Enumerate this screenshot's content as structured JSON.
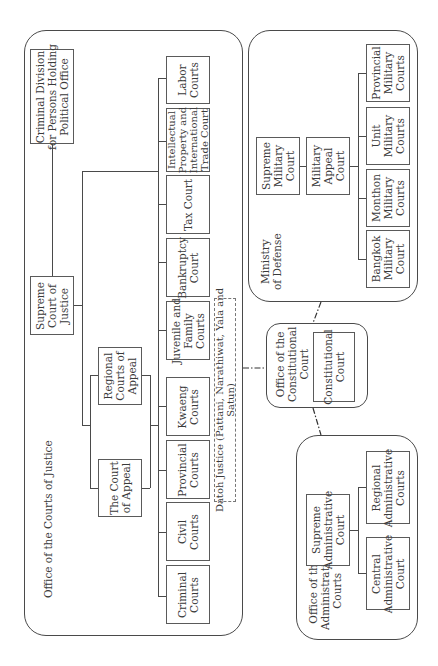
{
  "diagram": {
    "orientation": "rotated-90-ccw",
    "groups": {
      "courts_of_justice": {
        "label": "Office of the Courts of Justice",
        "boxes": {
          "criminal_division": [
            "Criminal Division",
            "for Persons Holding",
            "Political Office"
          ],
          "supreme_court": [
            "Supreme",
            "Court of",
            "Justice"
          ],
          "regional_appeal": [
            "Regional",
            "Courts of",
            "Appeal"
          ],
          "court_of_appeal": [
            "The Court",
            "of Appeal"
          ],
          "labor": [
            "Labor",
            "Courts"
          ],
          "ip_trade": [
            "Intellectual",
            "Property and",
            "International",
            "Trade Court"
          ],
          "tax": [
            "Tax Court"
          ],
          "bankruptcy": [
            "Bankruptcy",
            "Court"
          ],
          "juvenile": [
            "Juvenile and",
            "Family",
            "Courts"
          ],
          "kwaeng": [
            "Kwaeng",
            "Courts"
          ],
          "provincial": [
            "Provincial",
            "Courts"
          ],
          "civil": [
            "Civil",
            "Courts"
          ],
          "criminal": [
            "Criminal",
            "Courts"
          ]
        },
        "datoh_justice": [
          "Datoh Justice (Pattani, Narathiwat, Yala and",
          "Satun)"
        ]
      },
      "ministry_of_defense": {
        "label": [
          "Ministry",
          "of Defense"
        ],
        "boxes": {
          "supreme_military": [
            "Supreme",
            "Military",
            "Court"
          ],
          "military_appeal": [
            "Military",
            "Appeal",
            "Court"
          ],
          "provincial_military": [
            "Provincial",
            "Military",
            "Courts"
          ],
          "unit_military": [
            "Unit",
            "Military",
            "Courts"
          ],
          "monthon_military": [
            "Monthon",
            "Military",
            "Courts"
          ],
          "bangkok_military": [
            "Bangkok",
            "Military",
            "Court"
          ]
        }
      },
      "constitutional": {
        "label": [
          "Office of the",
          "Constitutional",
          "Court"
        ],
        "boxes": {
          "constitutional_court": [
            "Constitutional",
            "Court"
          ]
        }
      },
      "administrative": {
        "label": [
          "Office of the",
          "Administrative",
          "Courts"
        ],
        "boxes": {
          "supreme_admin": [
            "Supreme",
            "Administrative",
            "Court"
          ],
          "regional_admin": [
            "Regional",
            "Administrative",
            "Courts"
          ],
          "central_admin": [
            "Central",
            "Administrative",
            "Court"
          ]
        }
      }
    },
    "colors": {
      "line": "#4a4a4a",
      "text": "#3a3a3a",
      "background": "#ffffff"
    }
  }
}
